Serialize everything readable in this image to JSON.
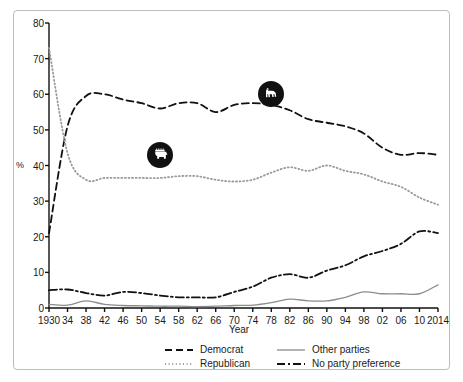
{
  "chart_data": {
    "type": "line",
    "title": "",
    "xlabel": "Year",
    "ylabel": "%",
    "xlim": [
      1930,
      2014
    ],
    "ylim": [
      0,
      80
    ],
    "grid": false,
    "legend_position": "bottom",
    "x": [
      1930,
      1934,
      1938,
      1942,
      1946,
      1950,
      1954,
      1958,
      1962,
      1966,
      1970,
      1974,
      1978,
      1982,
      1986,
      1990,
      1994,
      1998,
      2002,
      2006,
      2010,
      2014
    ],
    "xtick_labels": [
      "1930",
      "34",
      "38",
      "42",
      "46",
      "50",
      "54",
      "58",
      "62",
      "66",
      "70",
      "74",
      "78",
      "82",
      "86",
      "90",
      "94",
      "98",
      "02",
      "06",
      "10",
      "2014"
    ],
    "ytick_labels": [
      "0",
      "10",
      "20",
      "30",
      "40",
      "50",
      "60",
      "70",
      "80"
    ],
    "ytick_values": [
      0,
      10,
      20,
      30,
      40,
      50,
      60,
      70,
      80
    ],
    "series": [
      {
        "name": "Democrat",
        "style": "dashed",
        "color": "#111111",
        "values": [
          21,
          51,
          59.5,
          60,
          58.5,
          57.5,
          56,
          57.5,
          57.5,
          55,
          57,
          57.5,
          57,
          55.5,
          53,
          52,
          51,
          49,
          45,
          43,
          43.5,
          43
        ]
      },
      {
        "name": "Republican",
        "style": "dotted",
        "color": "#9a9a9a",
        "values": [
          73,
          43.5,
          36,
          36.5,
          36.5,
          36.5,
          36.5,
          37,
          37,
          36,
          35.5,
          36,
          38,
          39.5,
          38.5,
          40,
          38.5,
          37.5,
          35.5,
          34,
          31,
          29
        ]
      },
      {
        "name": "Other parties",
        "style": "solid",
        "color": "#8c8c8c",
        "values": [
          1,
          0.8,
          2,
          1,
          0.7,
          0.6,
          0.5,
          0.5,
          0.4,
          0.5,
          0.7,
          0.8,
          1.5,
          2.5,
          2,
          2,
          3,
          4.5,
          4,
          4,
          4,
          6.5
        ]
      },
      {
        "name": "No party preference",
        "style": "dashdot",
        "color": "#111111",
        "values": [
          5,
          5.2,
          4.2,
          3.5,
          4.5,
          4.2,
          3.5,
          3,
          3,
          3,
          4.5,
          6,
          8.5,
          9.5,
          8.5,
          10.5,
          12,
          14.5,
          16,
          18,
          21.5,
          21
        ]
      }
    ],
    "markers": [
      {
        "name": "republican-elephant-marker",
        "icon": "elephant-icon",
        "x": 1954,
        "y": 43
      },
      {
        "name": "democrat-donkey-marker",
        "icon": "donkey-icon",
        "x": 1978,
        "y": 60
      }
    ]
  },
  "legend": {
    "items": [
      {
        "label": "Democrat",
        "style": "dashed"
      },
      {
        "label": "Other parties",
        "style": "solid"
      },
      {
        "label": "Republican",
        "style": "dotted"
      },
      {
        "label": "No party preference",
        "style": "dashdot"
      }
    ]
  }
}
